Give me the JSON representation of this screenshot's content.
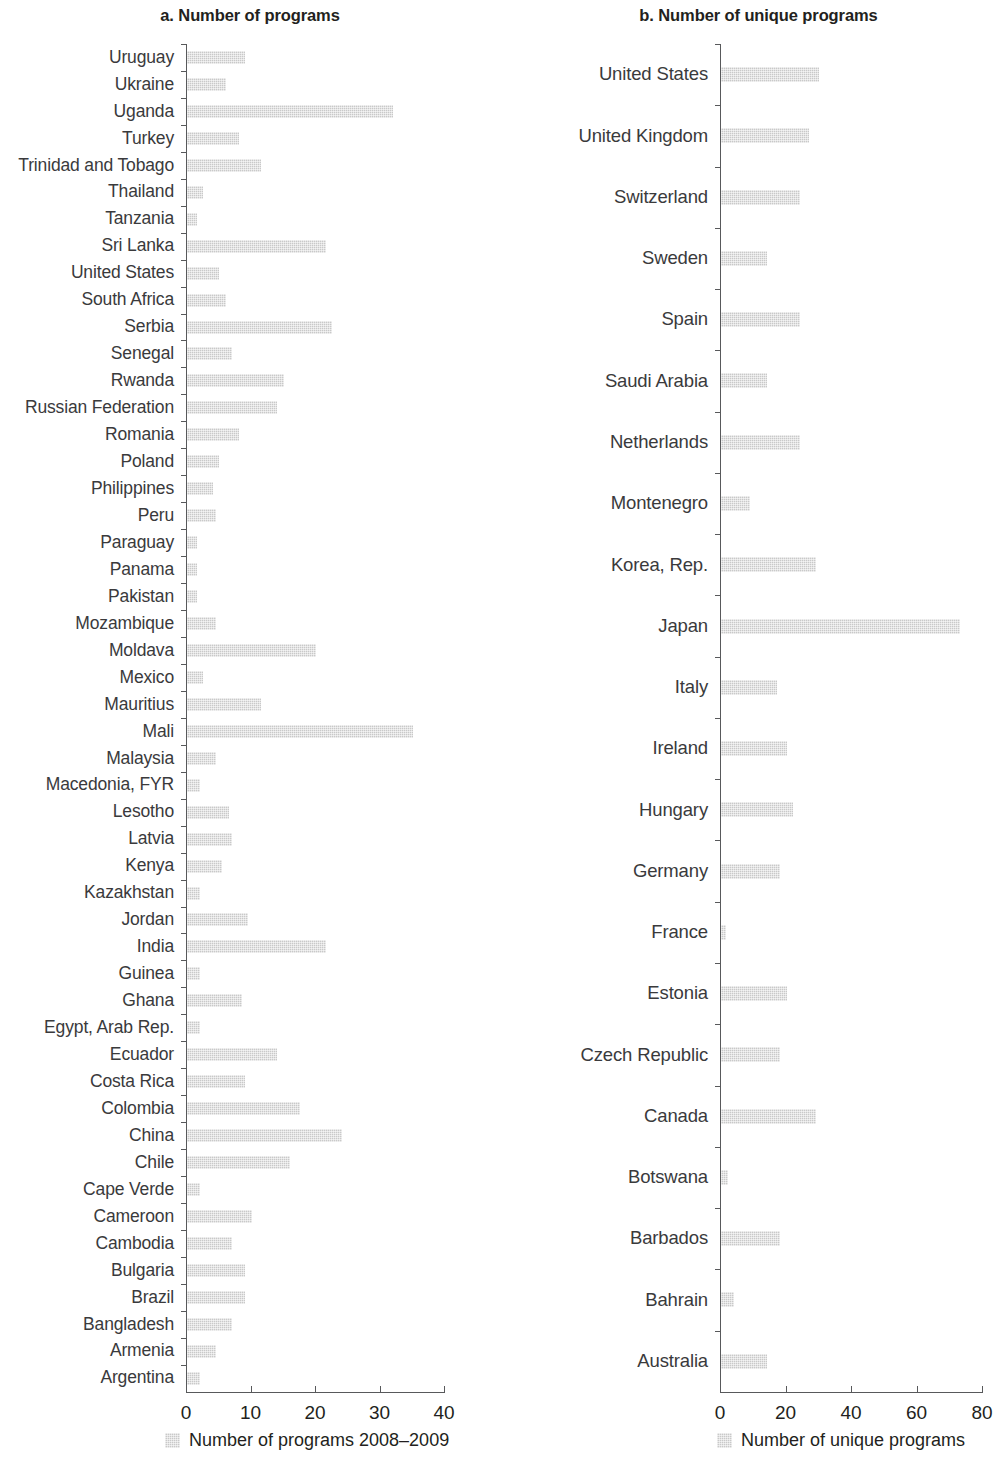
{
  "chart_data": [
    {
      "type": "bar",
      "orientation": "horizontal",
      "panel": "a",
      "title": "a. Number of programs",
      "xlabel": "",
      "ylabel": "",
      "xlim": [
        0,
        40
      ],
      "xticks": [
        0,
        10,
        20,
        30,
        40
      ],
      "grid": false,
      "legend": [
        "Number of programs 2008–2009"
      ],
      "legend_position": "bottom-left",
      "series_name": "Number of programs 2008–2009",
      "categories": [
        "Uruguay",
        "Ukraine",
        "Uganda",
        "Turkey",
        "Trinidad and Tobago",
        "Thailand",
        "Tanzania",
        "Sri Lanka",
        "United States",
        "South Africa",
        "Serbia",
        "Senegal",
        "Rwanda",
        "Russian Federation",
        "Romania",
        "Poland",
        "Philippines",
        "Peru",
        "Paraguay",
        "Panama",
        "Pakistan",
        "Mozambique",
        "Moldava",
        "Mexico",
        "Mauritius",
        "Mali",
        "Malaysia",
        "Macedonia, FYR",
        "Lesotho",
        "Latvia",
        "Kenya",
        "Kazakhstan",
        "Jordan",
        "India",
        "Guinea",
        "Ghana",
        "Egypt, Arab Rep.",
        "Ecuador",
        "Costa Rica",
        "Colombia",
        "China",
        "Chile",
        "Cape Verde",
        "Cameroon",
        "Cambodia",
        "Bulgaria",
        "Brazil",
        "Bangladesh",
        "Armenia",
        "Argentina"
      ],
      "values": [
        9,
        6,
        32,
        8,
        11.5,
        2.5,
        1.5,
        21.5,
        5,
        6,
        22.5,
        7,
        15,
        14,
        8,
        5,
        4,
        4.5,
        1.5,
        1.5,
        1.5,
        4.5,
        20,
        2.5,
        11.5,
        35,
        4.5,
        2,
        6.5,
        7,
        5.5,
        2,
        9.5,
        21.5,
        2,
        8.5,
        2,
        14,
        9,
        17.5,
        24,
        16,
        2,
        10,
        7,
        9,
        9,
        7,
        4.5,
        2
      ]
    },
    {
      "type": "bar",
      "orientation": "horizontal",
      "panel": "b",
      "title": "b. Number of unique programs",
      "xlabel": "",
      "ylabel": "",
      "xlim": [
        0,
        80
      ],
      "xticks": [
        0,
        20,
        40,
        60,
        80
      ],
      "grid": false,
      "legend": [
        "Number of unique programs"
      ],
      "legend_position": "bottom-left",
      "series_name": "Number of unique programs",
      "categories": [
        "United States",
        "United Kingdom",
        "Switzerland",
        "Sweden",
        "Spain",
        "Saudi Arabia",
        "Netherlands",
        "Montenegro",
        "Korea, Rep.",
        "Japan",
        "Italy",
        "Ireland",
        "Hungary",
        "Germany",
        "France",
        "Estonia",
        "Czech Republic",
        "Canada",
        "Botswana",
        "Barbados",
        "Bahrain",
        "Australia"
      ],
      "values": [
        30,
        27,
        24,
        14,
        24,
        14,
        24,
        9,
        29,
        73,
        17,
        20,
        22,
        18,
        1.5,
        20,
        18,
        29,
        2,
        18,
        4,
        14
      ]
    }
  ]
}
